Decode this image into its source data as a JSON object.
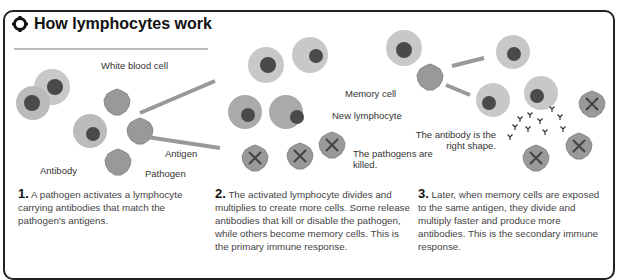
{
  "title": "How lymphocytes work",
  "icon": "gear-icon",
  "labels": {
    "white_blood_cell": "White blood cell",
    "antigen": "Antigen",
    "antibody": "Antibody",
    "pathogen": "Pathogen",
    "memory_cell": "Memory cell",
    "new_lymphocyte": "New lymphocyte",
    "pathogens_killed": "The pathogens are killed.",
    "antibody_shape": "The antibody is the right shape."
  },
  "steps": [
    {
      "num": "1.",
      "text": "A pathogen activates a lymphocyte carrying antibodies that match the pathogen's antigens."
    },
    {
      "num": "2.",
      "text": "The activated lymphocyte divides and multiplies to create more cells. Some release antibodies that kill or disable the pathogen, while others become memory cells. This is the primary immune response."
    },
    {
      "num": "3.",
      "text": "Later, when memory cells are exposed to the same antigen, they divide and multiply faster and produce more antibodies. This is the secondary immune response."
    }
  ],
  "colors": {
    "cell": "#c8c8c8",
    "cell_dark": "#a8a8a8",
    "nucleus": "#4a4a4a",
    "pathogen": "#999999",
    "arrow": "#999999"
  }
}
